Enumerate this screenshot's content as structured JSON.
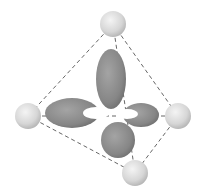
{
  "diagram": {
    "colors": {
      "background": "#ffffff",
      "lobe": "#8a8a8a",
      "lobe_highlight": "#b0b0b0",
      "sphere": "#dcdcdc",
      "edge": "#555555"
    },
    "spheres": [
      {
        "name": "top",
        "cx": 113,
        "cy": 24,
        "r": 13
      },
      {
        "name": "left",
        "cx": 28,
        "cy": 116,
        "r": 13
      },
      {
        "name": "right",
        "cx": 178,
        "cy": 116,
        "r": 13
      },
      {
        "name": "bottom",
        "cx": 135,
        "cy": 173,
        "r": 13
      }
    ]
  }
}
